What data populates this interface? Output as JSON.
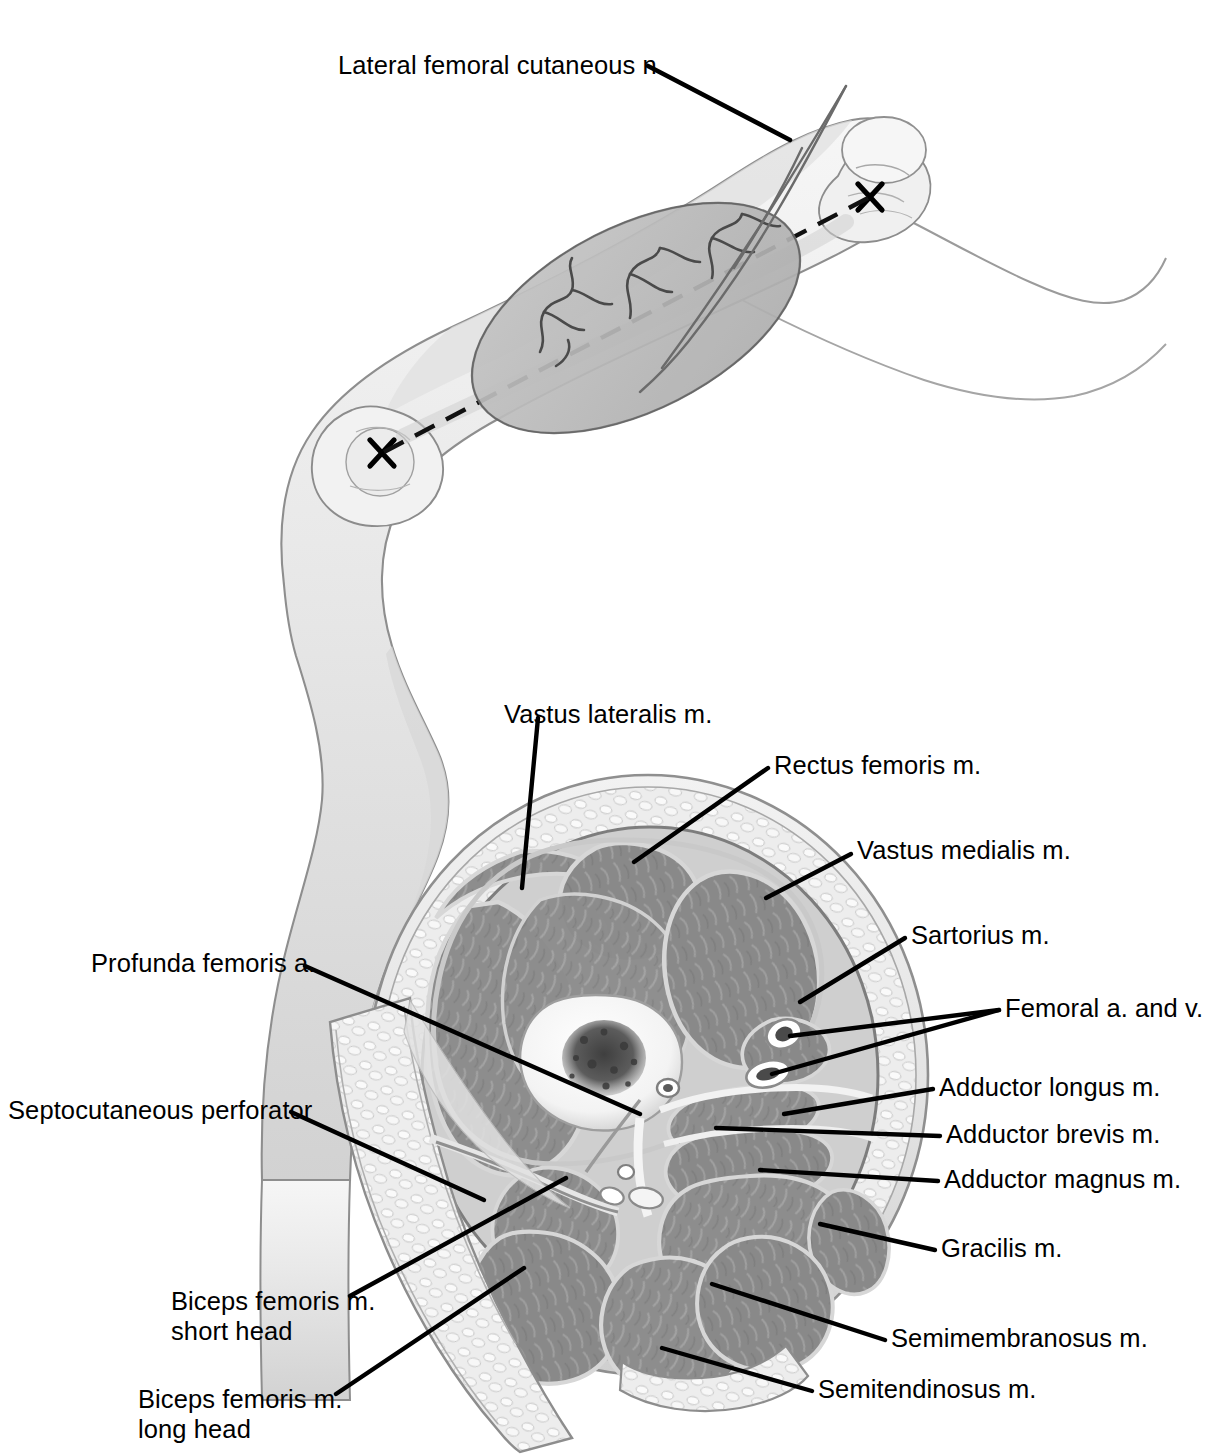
{
  "figure": {
    "panels": [
      {
        "id": "upper",
        "name": "lateral-thigh-surface-view"
      },
      {
        "id": "lower",
        "name": "mid-thigh-cross-section"
      }
    ]
  },
  "ink": {
    "leader": "#000000",
    "text": "#000000",
    "muscle": "#8d8d8d",
    "muscle_dark": "#7a7a7a",
    "fascia": "#d9d9d9",
    "fat": "#e8e8e8",
    "skin_line": "#9a9a9a",
    "bone": "#ffffff",
    "marrow": "#555555",
    "flap_shade": "#b9b9b9",
    "skin_shade": "#dcdcdc",
    "background": "#ffffff"
  },
  "upper_panel": {
    "labels": [
      {
        "id": "lat-fem-cut-n",
        "text": "Lateral femoral cutaneous n.",
        "x": 338,
        "y": 50
      }
    ],
    "markers": [
      {
        "id": "proximal-landmark-x",
        "name": "x-mark-proximal",
        "x": 869,
        "y": 196
      },
      {
        "id": "distal-landmark-x",
        "name": "x-mark-distal",
        "x": 381,
        "y": 452
      }
    ],
    "features": [
      "dashed-axis-line",
      "flap-ellipse-outline",
      "septocutaneous-perforator-vessels",
      "lateral-femoral-cutaneous-nerve-branches",
      "greater-trochanter",
      "lateral-femoral-condyle",
      "flexed-knee-silhouette"
    ]
  },
  "cross_section": {
    "labels_top": [
      {
        "id": "vastus-lateralis",
        "text": "Vastus lateralis m.",
        "x": 504,
        "y": 699
      },
      {
        "id": "rectus-femoris",
        "text": "Rectus femoris m.",
        "x": 774,
        "y": 750
      }
    ],
    "labels_right": [
      {
        "id": "vastus-medialis",
        "text": "Vastus medialis m.",
        "x": 857,
        "y": 835
      },
      {
        "id": "sartorius",
        "text": "Sartorius m.",
        "x": 911,
        "y": 920
      },
      {
        "id": "femoral-a-v",
        "text": "Femoral a. and v.",
        "x": 1005,
        "y": 993
      },
      {
        "id": "adductor-longus",
        "text": "Adductor longus m.",
        "x": 939,
        "y": 1072
      },
      {
        "id": "adductor-brevis",
        "text": "Adductor brevis m.",
        "x": 946,
        "y": 1119
      },
      {
        "id": "adductor-magnus",
        "text": "Adductor magnus m.",
        "x": 944,
        "y": 1164
      },
      {
        "id": "gracilis",
        "text": "Gracilis m.",
        "x": 941,
        "y": 1233
      },
      {
        "id": "semimembranosus",
        "text": "Semimembranosus m.",
        "x": 891,
        "y": 1323
      },
      {
        "id": "semitendinosus",
        "text": "Semitendinosus m.",
        "x": 818,
        "y": 1374
      }
    ],
    "labels_left": [
      {
        "id": "profunda-femoris",
        "text": "Profunda femoris a.",
        "x": 91,
        "y": 948
      },
      {
        "id": "septocutaneous-perforator",
        "text": "Septocutaneous perforator",
        "x": 8,
        "y": 1095
      },
      {
        "id": "biceps-femoris-short",
        "text": "Biceps femoris m.\nshort head",
        "x": 171,
        "y": 1286
      },
      {
        "id": "biceps-femoris-long",
        "text": "Biceps femoris m.\nlong head",
        "x": 138,
        "y": 1384
      }
    ],
    "structures": [
      "femur-with-marrow",
      "subcutaneous-fat-ring",
      "skin-envelope",
      "intermuscular-septa",
      "elevated-lateral-skin-flap",
      "lateral-intermuscular-septum",
      "profunda-femoris-vessels",
      "femoral-vessels"
    ]
  }
}
